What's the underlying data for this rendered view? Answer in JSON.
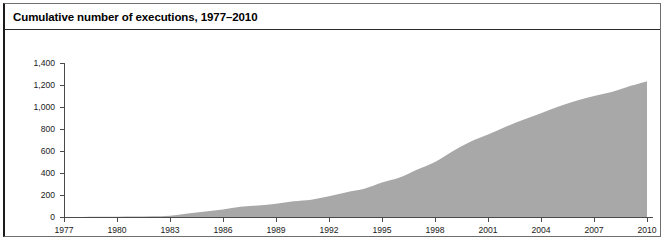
{
  "figure": {
    "title": "Cumulative number of executions, 1977–2010",
    "background_color": "#ffffff",
    "frame_color": "#1a1a1a"
  },
  "chart_data": {
    "type": "area",
    "title": "Cumulative number of executions, 1977–2010",
    "xlabel": "",
    "ylabel": "",
    "series_name": "Cumulative executions",
    "fill_color": "#a8a8a8",
    "grid": false,
    "legend": "none",
    "xlim": [
      1977,
      2010
    ],
    "ylim": [
      0,
      1400
    ],
    "y_ticks": [
      0,
      200,
      400,
      600,
      800,
      1000,
      1200,
      1400
    ],
    "y_tick_labels": [
      "0",
      "200",
      "400",
      "600",
      "800",
      "1,000",
      "1,200",
      "1,400"
    ],
    "x_ticks": [
      1977,
      1980,
      1983,
      1986,
      1989,
      1992,
      1995,
      1998,
      2001,
      2004,
      2007,
      2010
    ],
    "x_tick_labels": [
      "1977",
      "1980",
      "1983",
      "1986",
      "1989",
      "1992",
      "1995",
      "1998",
      "2001",
      "2004",
      "2007",
      "2010"
    ],
    "x": [
      1977,
      1978,
      1979,
      1980,
      1981,
      1982,
      1983,
      1984,
      1985,
      1986,
      1987,
      1988,
      1989,
      1990,
      1991,
      1992,
      1993,
      1994,
      1995,
      1996,
      1997,
      1998,
      1999,
      2000,
      2001,
      2002,
      2003,
      2004,
      2005,
      2006,
      2007,
      2008,
      2009,
      2010
    ],
    "values": [
      0,
      1,
      3,
      3,
      4,
      6,
      11,
      32,
      50,
      68,
      93,
      104,
      120,
      143,
      157,
      188,
      226,
      257,
      313,
      358,
      432,
      500,
      598,
      683,
      749,
      820,
      885,
      944,
      1004,
      1057,
      1099,
      1136,
      1188,
      1234
    ]
  }
}
